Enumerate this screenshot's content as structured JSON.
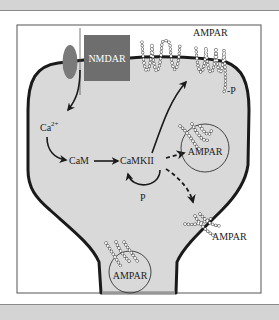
{
  "figure": {
    "title": "",
    "colors": {
      "cytoplasm": "#d9d9d9",
      "membrane": "#1a1a1a",
      "nmdar_box": "#6e6e6e",
      "channel_ellipse": "#7a7a7a",
      "frame": "#555555",
      "band": "#d4d4d4"
    },
    "labels": {
      "nmdar": "NMDAR",
      "ampar_top": "AMPAR",
      "phospho_top": "-P",
      "calcium": "Ca",
      "calcium_sup": "2+",
      "cam": "CaM",
      "camkii": "CaMKII",
      "phospho_loop": "P",
      "ampar_vesicle_upper": "AMPAR",
      "ampar_membrane_lower": "AMPAR",
      "ampar_vesicle_neck": "AMPAR"
    },
    "nodes": [
      {
        "id": "nmdar",
        "label": "NMDAR",
        "type": "receptor"
      },
      {
        "id": "ca",
        "label": "Ca2+",
        "type": "ion"
      },
      {
        "id": "cam",
        "label": "CaM",
        "type": "protein"
      },
      {
        "id": "camkii",
        "label": "CaMKII",
        "type": "kinase"
      },
      {
        "id": "ampar_surface",
        "label": "AMPAR",
        "type": "receptor",
        "modification": "P"
      },
      {
        "id": "ampar_vesicle",
        "label": "AMPAR",
        "type": "vesicle"
      },
      {
        "id": "ampar_lateral",
        "label": "AMPAR",
        "type": "receptor"
      },
      {
        "id": "ampar_neck_vesicle",
        "label": "AMPAR",
        "type": "vesicle"
      }
    ],
    "edges": [
      {
        "from": "nmdar",
        "to": "ca",
        "style": "solid"
      },
      {
        "from": "ca",
        "to": "cam",
        "style": "solid"
      },
      {
        "from": "cam",
        "to": "camkii",
        "style": "solid"
      },
      {
        "from": "camkii",
        "to": "camkii",
        "style": "solid",
        "label": "P"
      },
      {
        "from": "camkii",
        "to": "ampar_surface",
        "style": "solid"
      },
      {
        "from": "camkii",
        "to": "ampar_vesicle",
        "style": "dashed"
      },
      {
        "from": "camkii",
        "to": "ampar_lateral",
        "style": "dashed"
      }
    ]
  }
}
